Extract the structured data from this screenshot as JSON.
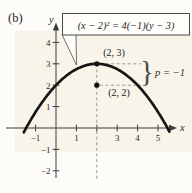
{
  "figure_label": "(b)",
  "colors": {
    "background": "#fdfcf8",
    "plot_tint": "#f6edde",
    "curve": "#151515",
    "axis": "#3c3c3c",
    "dashed_line": "#8f8f8f",
    "box_border": "#4a4a4a",
    "box_fill": "#fffefb",
    "text": "#1f1f1f"
  },
  "equation_box": {
    "text": "(x − 2)² = 4(−1)(y − 3)"
  },
  "annotations": {
    "vertex_label": "(2, 3)",
    "focus_label": "(2, 2)",
    "p_label": "p = −1",
    "brace": "}"
  },
  "axes": {
    "x_label": "x",
    "y_label": "y",
    "x_ticks": [
      {
        "v": -1,
        "label": "−1"
      },
      {
        "v": 1,
        "label": "1"
      },
      {
        "v": 2,
        "label": ""
      },
      {
        "v": 3,
        "label": "3"
      },
      {
        "v": 4,
        "label": "4"
      },
      {
        "v": 5,
        "label": "5"
      }
    ],
    "y_ticks": [
      {
        "v": -2,
        "label": "−2"
      },
      {
        "v": -1,
        "label": "−1"
      },
      {
        "v": 1,
        "label": "1"
      },
      {
        "v": 2,
        "label": "2"
      },
      {
        "v": 3,
        "label": "3"
      },
      {
        "v": 4,
        "label": "4"
      }
    ]
  },
  "chart_data": {
    "type": "line",
    "equation": "(x − 2)² = 4(−1)(y − 3)",
    "function": "y = 3 − (x − 2)²/4",
    "vertex": [
      2,
      3
    ],
    "focus": [
      2,
      2
    ],
    "p": -1,
    "axis_of_symmetry": "x = 2",
    "opens": "downward",
    "x_range_drawn": [
      -1.58,
      5.58
    ],
    "sample_points": {
      "x": [
        -1.5,
        -1,
        0,
        1,
        2,
        3,
        4,
        5,
        5.5
      ],
      "y": [
        -0.06,
        0.75,
        2,
        2.75,
        3,
        2.75,
        2,
        0.75,
        -0.06
      ]
    },
    "xlim": [
      -2,
      6
    ],
    "ylim": [
      -2.7,
      5
    ],
    "xlabel": "x",
    "ylabel": "y",
    "grid": false,
    "legend": null
  }
}
